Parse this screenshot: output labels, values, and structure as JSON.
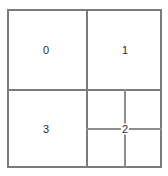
{
  "diagram": {
    "type": "quadtree-partition",
    "background_color": "#ffffff",
    "line_color": "#7b7b7b",
    "inner_line_color": "#8d8d8d",
    "label_color": "#2b2b2b",
    "bounds": {
      "x": 7,
      "y": 9,
      "width": 155,
      "height": 159
    },
    "main_split": {
      "vertical_x": 86,
      "horizontal_y": 89
    },
    "subgrid_split": {
      "vertical_x": 124,
      "horizontal_y": 128
    },
    "cells": [
      {
        "id": "0",
        "label": "0",
        "region": "top-left",
        "label_x": 46,
        "label_y": 50,
        "on_junction": false
      },
      {
        "id": "1",
        "label": "1",
        "region": "top-right",
        "label_x": 125,
        "label_y": 50,
        "on_junction": false
      },
      {
        "id": "2",
        "label": "2",
        "region": "bottom-right",
        "label_x": 125,
        "label_y": 129,
        "on_junction": true
      },
      {
        "id": "3",
        "label": "3",
        "region": "bottom-left",
        "label_x": 46,
        "label_y": 129,
        "on_junction": false
      }
    ],
    "subcells": [
      {
        "id": "2a",
        "region": "bottom-right-upper-left"
      },
      {
        "id": "2b",
        "region": "bottom-right-upper-right"
      },
      {
        "id": "2c",
        "region": "bottom-right-lower-left"
      },
      {
        "id": "2d",
        "region": "bottom-right-lower-right"
      }
    ]
  }
}
